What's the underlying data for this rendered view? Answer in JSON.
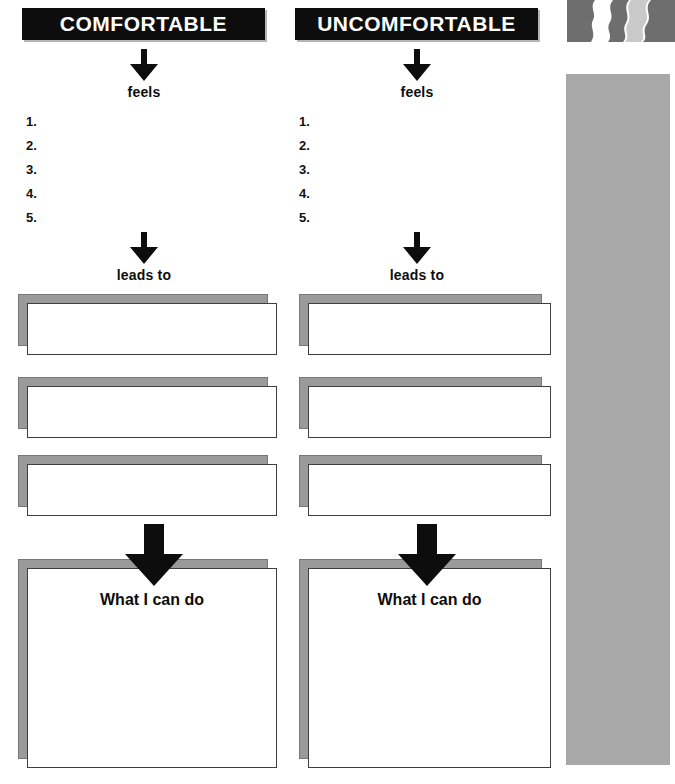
{
  "worksheet": {
    "columns": [
      {
        "id": "comfortable",
        "header": "COMFORTABLE",
        "feels_label": "feels",
        "list_items": [
          "1.",
          "2.",
          "3.",
          "4.",
          "5."
        ],
        "leads_to_label": "leads to",
        "action_box_title": "What I can do",
        "middle_boxes": [
          "",
          "",
          ""
        ]
      },
      {
        "id": "uncomfortable",
        "header": "UNCOMFORTABLE",
        "feels_label": "feels",
        "list_items": [
          "1.",
          "2.",
          "3.",
          "4.",
          "5."
        ],
        "leads_to_label": "leads to",
        "action_box_title": "What I can do",
        "middle_boxes": [
          "",
          "",
          ""
        ]
      }
    ]
  },
  "decor": {
    "graphic_name": "face-profiles-graphic",
    "sidebar_name": "gray-sidebar-bar"
  },
  "colors": {
    "header_bar": "#0d0d0d",
    "header_text": "#ffffff",
    "box_shadow": "#9a9a9a",
    "box_fill": "#ffffff",
    "box_border": "#3f3f3f",
    "sidebar_gray": "#a8a8a8",
    "arrow": "#0d0d0d"
  }
}
